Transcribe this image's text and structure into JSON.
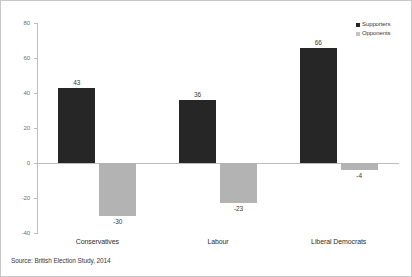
{
  "chart_data": {
    "type": "bar",
    "title": "",
    "xlabel": "",
    "ylabel": "",
    "ylim": [
      -40,
      80
    ],
    "yticks": [
      80,
      60,
      40,
      20,
      0,
      -20,
      -40
    ],
    "ytick_labels": [
      "80",
      "60",
      "40",
      "20",
      "0",
      "-20",
      "-40"
    ],
    "grid": false,
    "legend_position": "top-right",
    "categories": [
      "Conservatives",
      "Labour",
      "Liberal Democrats"
    ],
    "series": [
      {
        "name": "Supporters",
        "color": "#262626",
        "values": [
          43,
          36,
          66
        ],
        "labels": [
          "43",
          "36",
          "66"
        ]
      },
      {
        "name": "Opponents",
        "color": "#b3b3b3",
        "values": [
          -30,
          -23,
          -4
        ],
        "labels": [
          "-30",
          "-23",
          "-4"
        ]
      }
    ],
    "source_note": "Source: British Election Study, 2014"
  },
  "legend": {
    "items": [
      {
        "label": "Supporters"
      },
      {
        "label": "Opponents"
      }
    ]
  },
  "footer": {
    "source": "Source: British Election Study, 2014"
  },
  "colors": {
    "supporters": "#262626",
    "opponents": "#b3b3b3",
    "axis": "#bdbdbd",
    "text": "#3a3a3a",
    "border": "#c8c8c8"
  }
}
